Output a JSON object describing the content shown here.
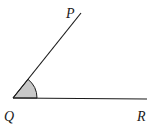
{
  "diagram": {
    "type": "angle",
    "points": {
      "P": {
        "label": "P",
        "x": 81,
        "y": 13
      },
      "Q": {
        "label": "Q",
        "x": 13,
        "y": 98
      },
      "R": {
        "label": "R",
        "x": 147,
        "y": 99
      }
    },
    "labels": {
      "P": "P",
      "Q": "Q",
      "R": "R"
    },
    "colors": {
      "line": "#1a1a1a",
      "arc_fill": "#c8c8c8"
    }
  }
}
